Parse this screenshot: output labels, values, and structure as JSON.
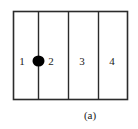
{
  "figure": {
    "caption": "(a)",
    "caption_x": 70,
    "caption_y": 110,
    "background_color": "#ffffff",
    "stroke_color": "#2b2b2b",
    "fill_color": "#000000",
    "outer_rect": {
      "x": 13,
      "y": 11,
      "width": 115,
      "height": 89
    },
    "divider_lines_x": [
      38,
      68,
      98
    ],
    "cells": [
      {
        "label": "1",
        "x": 20,
        "y": 56
      },
      {
        "label": "2",
        "x": 49,
        "y": 56
      },
      {
        "label": "3",
        "x": 79,
        "y": 56
      },
      {
        "label": "4",
        "x": 108,
        "y": 56
      }
    ],
    "marker": {
      "name": "filled-ellipse-marker",
      "cx": 38,
      "cy": 61,
      "rx": 6,
      "ry": 5.5,
      "color": "#000000"
    }
  }
}
